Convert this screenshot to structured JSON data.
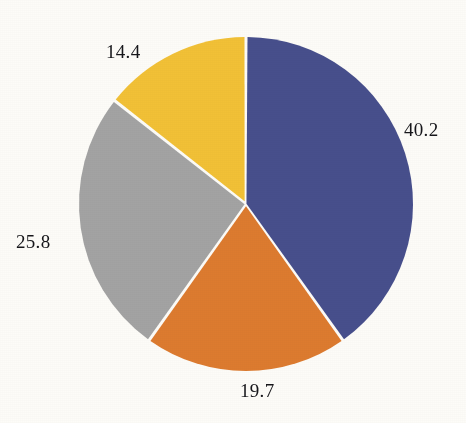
{
  "background_color": "#fdfcf8",
  "label_color": "#16161a",
  "gap_color": "#ffffff",
  "chart_data": {
    "type": "pie",
    "title": "",
    "subtitle": "",
    "xlabel": "",
    "ylabel": "",
    "legend": "none",
    "grid": false,
    "start_angle_deg": 0,
    "direction": "clockwise",
    "center": {
      "x": 246,
      "y": 204
    },
    "radius": 167,
    "slice_gap_px": 3,
    "categories": [
      "40.2",
      "19.7",
      "25.8",
      "14.4"
    ],
    "values": [
      40.2,
      19.7,
      25.8,
      14.4
    ],
    "total": 100.1,
    "colors": [
      "#474f8c",
      "#dd7b2f",
      "#a3a3a3",
      "#f2c136"
    ],
    "slices": [
      {
        "label": "40.2",
        "value": 40.2,
        "color": "#474f8c",
        "color_name": "indigo-blue",
        "start_angle_deg": 0.0,
        "end_angle_deg": 144.7,
        "label_position": "right"
      },
      {
        "label": "19.7",
        "value": 19.7,
        "color": "#dd7b2f",
        "color_name": "orange",
        "start_angle_deg": 144.7,
        "end_angle_deg": 215.6,
        "label_position": "bottom"
      },
      {
        "label": "25.8",
        "value": 25.8,
        "color": "#a3a3a3",
        "color_name": "gray",
        "start_angle_deg": 215.6,
        "end_angle_deg": 308.4,
        "label_position": "left"
      },
      {
        "label": "14.4",
        "value": 14.4,
        "color": "#f2c136",
        "color_name": "gold-yellow",
        "start_angle_deg": 308.4,
        "end_angle_deg": 360.0,
        "label_position": "top-left"
      }
    ]
  },
  "labels": {
    "blue": "40.2",
    "orange": "19.7",
    "gray": "25.8",
    "yellow": "14.4"
  }
}
